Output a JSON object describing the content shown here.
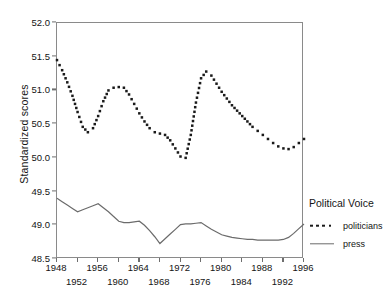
{
  "chart_data": {
    "type": "line",
    "title": "",
    "xlabel": "",
    "ylabel": "Standardized scores",
    "xlim": [
      1948,
      1996
    ],
    "ylim": [
      48.5,
      52.0
    ],
    "yticks": [
      "52.0",
      "51.5",
      "51.0",
      "50.5",
      "50.0",
      "49.5",
      "49.0",
      "48.5"
    ],
    "xticks": [
      "1948",
      "1952",
      "1956",
      "1960",
      "1964",
      "1968",
      "1972",
      "1976",
      "1980",
      "1984",
      "1988",
      "1992",
      "1996"
    ],
    "grid": false,
    "legend_position": "right",
    "legend_title": "Political Voice",
    "x": [
      1948,
      1949,
      1950,
      1951,
      1952,
      1953,
      1954,
      1955,
      1956,
      1957,
      1958,
      1959,
      1960,
      1961,
      1962,
      1963,
      1964,
      1965,
      1966,
      1967,
      1968,
      1969,
      1970,
      1971,
      1972,
      1973,
      1974,
      1975,
      1976,
      1977,
      1978,
      1979,
      1980,
      1981,
      1982,
      1983,
      1984,
      1985,
      1986,
      1987,
      1988,
      1989,
      1990,
      1991,
      1992,
      1993,
      1994,
      1995,
      1996
    ],
    "series": [
      {
        "name": "politicians",
        "style": "dotted",
        "color": "#1a1a1a",
        "values": [
          51.45,
          51.3,
          51.12,
          50.92,
          50.68,
          50.46,
          50.38,
          50.44,
          50.62,
          50.84,
          51.0,
          51.04,
          51.05,
          51.04,
          50.94,
          50.8,
          50.66,
          50.54,
          50.44,
          50.38,
          50.36,
          50.34,
          50.26,
          50.14,
          50.02,
          50.0,
          50.34,
          50.82,
          51.18,
          51.28,
          51.22,
          51.1,
          50.98,
          50.88,
          50.78,
          50.7,
          50.62,
          50.54,
          50.46,
          50.4,
          50.34,
          50.28,
          50.22,
          50.17,
          50.14,
          50.13,
          50.16,
          50.22,
          50.28
        ]
      },
      {
        "name": "press",
        "style": "solid",
        "color": "#6b6b6b",
        "values": [
          49.4,
          49.35,
          49.3,
          49.25,
          49.2,
          49.23,
          49.26,
          49.29,
          49.32,
          49.26,
          49.2,
          49.13,
          49.06,
          49.04,
          49.04,
          49.05,
          49.06,
          49.0,
          48.92,
          48.83,
          48.73,
          48.8,
          48.87,
          48.94,
          49.01,
          49.02,
          49.02,
          49.03,
          49.04,
          48.99,
          48.94,
          48.9,
          48.86,
          48.84,
          48.82,
          48.81,
          48.8,
          48.79,
          48.79,
          48.78,
          48.78,
          48.78,
          48.78,
          48.78,
          48.79,
          48.82,
          48.88,
          48.95,
          49.02
        ]
      }
    ]
  },
  "legend": {
    "title": "Political Voice",
    "items": [
      {
        "label": "politicians",
        "style": "dotted"
      },
      {
        "label": "press",
        "style": "solid"
      }
    ]
  }
}
